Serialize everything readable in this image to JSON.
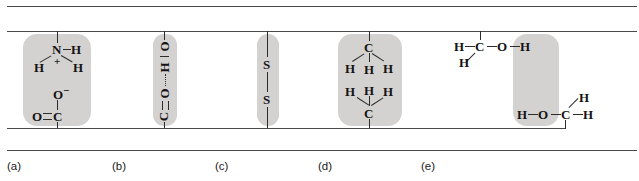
{
  "figure": {
    "background_color": "#ffffff",
    "highlight_color": "#d4d2d0",
    "bond_color": "#2c2c2c",
    "chain_color": "#4a4a4a"
  },
  "panels": [
    {
      "id": "a",
      "caption": "(a)",
      "interaction": "ionic-bond-salt-bridge",
      "top_group": {
        "center_atom": "N",
        "right_atom": "H",
        "left_atom": "H",
        "lower_right_atom": "H",
        "charge": "+"
      },
      "bottom_group": {
        "top_atom": "O",
        "top_charge": "−",
        "left_atom": "O",
        "center_atom": "C"
      }
    },
    {
      "id": "b",
      "caption": "(b)",
      "interaction": "hydrogen-bond",
      "atoms": [
        "O",
        "H",
        "O",
        "C"
      ],
      "bond_labels": {
        "single": "|",
        "dotted": "⋮",
        "double": "‖"
      }
    },
    {
      "id": "c",
      "caption": "(c)",
      "interaction": "disulfide-bridge",
      "atoms": [
        "S",
        "S"
      ]
    },
    {
      "id": "d",
      "caption": "(d)",
      "interaction": "hydrophobic-interaction",
      "top_group": {
        "center_atom": "C",
        "h_left": "H",
        "h_center": "H",
        "h_right": "H"
      },
      "bottom_group": {
        "center_atom": "C",
        "h_left": "H",
        "h_center": "H",
        "h_right": "H"
      }
    },
    {
      "id": "e",
      "caption": "(e)",
      "interaction": "hydrogen-bond-hydroxyl",
      "top_group": {
        "h_left": "H",
        "carbon": "C",
        "oxygen": "O",
        "h_right": "H",
        "h_below": "H"
      },
      "bottom_group": {
        "h_left": "H",
        "oxygen": "O",
        "carbon": "C",
        "h_right": "H",
        "h_above": "H"
      }
    }
  ]
}
